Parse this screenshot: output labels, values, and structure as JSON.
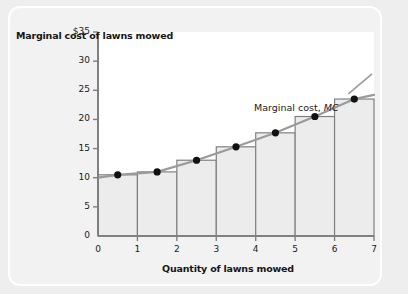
{
  "chart_data": {
    "type": "bar",
    "title": "",
    "xlabel": "Quantity of lawns mowed",
    "ylabel": "Marginal cost of lawns mowed",
    "xlim": [
      0,
      7
    ],
    "ylim": [
      0,
      35
    ],
    "grid": false,
    "legend_position": "upper-right",
    "legend_text": "Marginal cost, ",
    "legend_symbol": "MC",
    "series_name": "Marginal cost, MC",
    "categories": [
      "1",
      "2",
      "3",
      "4",
      "5",
      "6",
      "7"
    ],
    "bar_intervals": [
      [
        0,
        1
      ],
      [
        1,
        2
      ],
      [
        2,
        3
      ],
      [
        3,
        4
      ],
      [
        4,
        5
      ],
      [
        5,
        6
      ],
      [
        6,
        7
      ]
    ],
    "values": [
      10.5,
      11,
      13,
      15.3,
      17.7,
      20.5,
      23.5
    ],
    "point_x": [
      0.5,
      1.5,
      2.5,
      3.5,
      4.5,
      5.5,
      6.5
    ],
    "point_y": [
      10.5,
      11,
      13,
      15.3,
      17.7,
      20.5,
      23.5
    ],
    "curve_x": [
      0,
      0.5,
      1.5,
      2.5,
      3.5,
      4.5,
      5.5,
      6.5,
      7
    ],
    "curve_y": [
      10,
      10.5,
      11,
      13,
      15.3,
      17.7,
      20.5,
      23.5,
      24.2
    ],
    "ytick_values": [
      0,
      5,
      10,
      15,
      20,
      25,
      30,
      35
    ],
    "ytick_labels": [
      "0",
      "5",
      "10",
      "15",
      "20",
      "25",
      "30",
      "$35"
    ],
    "xtick_values": [
      0,
      1,
      2,
      3,
      4,
      5,
      6,
      7
    ],
    "xtick_labels": [
      "0",
      "1",
      "2",
      "3",
      "4",
      "5",
      "6",
      "7"
    ],
    "colors": {
      "bar_fill": "#ececec",
      "bar_stroke": "#808080",
      "curve": "#9a9a9a",
      "point": "#111111",
      "axis": "#808080",
      "plot_background": "#ffffff",
      "card_background": "#f2f2f2",
      "page_background": "#eeeeee",
      "text": "#161616"
    }
  }
}
